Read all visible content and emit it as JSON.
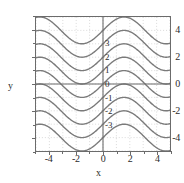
{
  "chart_data": {
    "type": "line",
    "title": "y = sin x + C",
    "xlabel": "x",
    "ylabel": "y",
    "xlim": [
      -5,
      5
    ],
    "ylim": [
      -5,
      5
    ],
    "grid": true,
    "grid_style": "dotted",
    "legend": "none",
    "x_ticks": [
      "-4",
      "-2",
      "0",
      "2",
      "4"
    ],
    "x_tick_values": [
      -4,
      -2,
      0,
      2,
      4
    ],
    "x_minor_ticks": [
      -5,
      -3,
      -1,
      1,
      3,
      5
    ],
    "y_ticks": [
      "4",
      "2",
      "0",
      "-2",
      "-4"
    ],
    "y_tick_values": [
      4,
      2,
      0,
      -2,
      -4
    ],
    "y_minor_ticks": [
      -5,
      -3,
      -1,
      1,
      3,
      5
    ],
    "function": "y = sin x + C",
    "curve_color": "#7a7a7a",
    "axis_color": "#6b6b6b",
    "grid_color": "#c9c9c9",
    "series": [
      {
        "name": "C = 4",
        "C": 4,
        "label": "",
        "label_x": 0,
        "label_y": 4
      },
      {
        "name": "C = 3",
        "C": 3,
        "label": "3",
        "label_x": 0,
        "label_y": 3
      },
      {
        "name": "C = 2",
        "C": 2,
        "label": "2",
        "label_x": 0,
        "label_y": 2
      },
      {
        "name": "C = 1",
        "C": 1,
        "label": "1",
        "label_x": 0,
        "label_y": 1
      },
      {
        "name": "C = 0",
        "C": 0,
        "label": "0",
        "label_x": 0,
        "label_y": 0
      },
      {
        "name": "C = -1",
        "C": -1,
        "label": "-1",
        "label_x": 0,
        "label_y": -1
      },
      {
        "name": "C = -2",
        "C": -2,
        "label": "-2",
        "label_x": 0,
        "label_y": -2
      },
      {
        "name": "C = -3",
        "C": -3,
        "label": "-3",
        "label_x": 0,
        "label_y": -3
      },
      {
        "name": "C = -4",
        "C": -4,
        "label": "",
        "label_x": 0,
        "label_y": -4
      }
    ],
    "curve_labels": [
      "3",
      "2",
      "1",
      "0",
      "-1",
      "-2",
      "-3"
    ]
  },
  "axes": {
    "y_label": "y",
    "x_label": "x",
    "title": "y = sin x + C"
  },
  "y_tick_labels": [
    "4",
    "2",
    "0",
    "-2",
    "-4"
  ],
  "x_tick_labels": [
    "-4",
    "-2",
    "0",
    "2",
    "4"
  ],
  "curve_labels": [
    "3",
    "2",
    "1",
    "0",
    "-1",
    "-2",
    "-3"
  ]
}
